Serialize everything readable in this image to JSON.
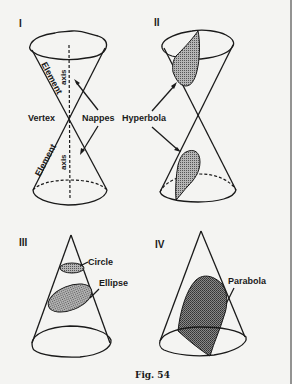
{
  "figure": {
    "caption": "Fig. 54",
    "panels": [
      {
        "id": "I",
        "numeral": "I",
        "labels": {
          "element_upper": "Element",
          "element_lower": "Element",
          "axis_upper": "axis",
          "axis_lower": "axis",
          "vertex": "Vertex",
          "nappes": "Nappes"
        }
      },
      {
        "id": "II",
        "numeral": "II",
        "labels": {
          "hyperbola": "Hyperbola"
        }
      },
      {
        "id": "III",
        "numeral": "III",
        "labels": {
          "circle": "Circle",
          "ellipse": "Ellipse"
        }
      },
      {
        "id": "IV",
        "numeral": "IV",
        "labels": {
          "parabola": "Parabola"
        }
      }
    ],
    "colors": {
      "ink": "#1a1a1a",
      "paper": "#f4f4f2",
      "shade": "#8a8a8a"
    }
  }
}
